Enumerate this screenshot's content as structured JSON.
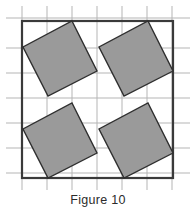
{
  "figure": {
    "caption": "Figure 10",
    "colors": {
      "square_fill": "#9a9a9a",
      "square_stroke": "#2f2f2f",
      "grid_line": "#b5b5b5",
      "border_line": "#3a3a3a",
      "background": "#ffffff",
      "caption_text": "#2b2b2b"
    },
    "canvas": {
      "width": 196,
      "height": 214
    },
    "grid": {
      "cell_size": 25,
      "vertical_lines_x": [
        22,
        47,
        72,
        97,
        122,
        147,
        172
      ],
      "horizontal_lines_y": [
        18,
        48,
        73,
        98,
        123,
        148,
        173
      ],
      "extend_start": 6,
      "extend_end": 190,
      "line_width": 1
    },
    "border": {
      "x": 22,
      "y": 21,
      "width": 151,
      "height": 157,
      "line_width": 2.2
    },
    "squares": [
      {
        "name": "top-left-square",
        "points": "72,21 97,71 48,96 23,47"
      },
      {
        "name": "top-right-square",
        "points": "148,21 173,71 124,96 99,47"
      },
      {
        "name": "bottom-left-square",
        "points": "72,103 97,153 48,178 23,129"
      },
      {
        "name": "bottom-right-square",
        "points": "148,103 173,153 124,178 99,129"
      }
    ]
  }
}
